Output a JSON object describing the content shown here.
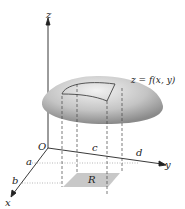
{
  "diagram": {
    "axes": {
      "x": "x",
      "y": "y",
      "z": "z",
      "origin": "O"
    },
    "x_ticks": [
      "a",
      "b"
    ],
    "y_ticks": [
      "c",
      "d"
    ],
    "surface_label": "z = f(x, y)",
    "region_label": "R",
    "colors": {
      "surface": "#b0b0b0",
      "region": "#c8c8c8",
      "axis": "#222222"
    }
  }
}
